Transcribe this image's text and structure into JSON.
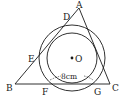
{
  "diagram": {
    "type": "geometry",
    "points": {
      "A": "A",
      "B": "B",
      "C": "C",
      "D": "D",
      "E": "E",
      "F": "F",
      "G": "G",
      "O": "O"
    },
    "measurement": "8 cm",
    "measurement_text": "8cm",
    "colors": {
      "stroke": "#1a1a1a",
      "background": "#ffffff"
    }
  }
}
